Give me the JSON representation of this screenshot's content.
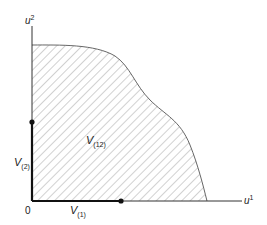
{
  "diagram": {
    "axes": {
      "x_label": "u",
      "x_label_sup": "1",
      "y_label": "u",
      "y_label_sup": "2",
      "origin_label": "0"
    },
    "region": {
      "label": "V",
      "label_sub": "(12)",
      "fill": "hatched"
    },
    "segments": [
      {
        "label": "V",
        "label_sub": "(2)",
        "axis": "vertical"
      },
      {
        "label": "V",
        "label_sub": "(1)",
        "axis": "horizontal"
      }
    ],
    "colors": {
      "axis": "#333333",
      "hatch": "#9a9a9a",
      "curve": "#555555",
      "segment": "#111111"
    }
  }
}
